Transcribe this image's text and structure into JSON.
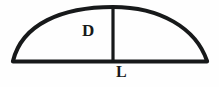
{
  "figure": {
    "background_color": "#fefefe",
    "stroke_color": "#17191a",
    "stroke_width": 4,
    "labels": {
      "height_label": "D",
      "length_label": "L"
    },
    "geometry": {
      "chord_left_point": [
        13,
        61
      ],
      "chord_right_point": [
        207,
        61
      ],
      "apex_point": [
        113,
        7
      ],
      "vertical_line_x": 113,
      "vertical_line_top_y": 8,
      "vertical_line_bottom_y": 61,
      "arc_type": "circular-segment"
    }
  }
}
